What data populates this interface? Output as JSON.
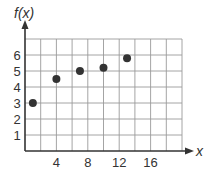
{
  "chart_data": {
    "type": "scatter",
    "title": "",
    "xlabel": "x",
    "ylabel": "f(x)",
    "xlim": [
      0,
      20
    ],
    "ylim": [
      0,
      7
    ],
    "grid": true,
    "x_grid_step": 2,
    "y_grid_step": 1,
    "x_tick_labels": [
      "4",
      "8",
      "12",
      "16"
    ],
    "x_ticks": [
      4,
      8,
      12,
      16
    ],
    "y_tick_labels": [
      "1",
      "2",
      "3",
      "4",
      "5",
      "6"
    ],
    "y_ticks": [
      1,
      2,
      3,
      4,
      5,
      6
    ],
    "x": [
      1,
      4,
      7,
      10,
      13
    ],
    "values": [
      3,
      4.5,
      5,
      5.2,
      5.8
    ],
    "point_color": "#333333",
    "grid_color": "#9a9a9a",
    "axis_color": "#333333"
  }
}
